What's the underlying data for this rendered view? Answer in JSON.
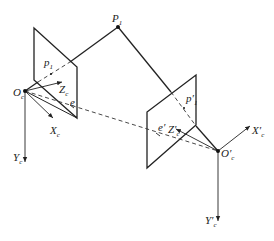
{
  "diagram": {
    "type": "epipolar-geometry",
    "colors": {
      "line": "#222222",
      "background": "#ffffff"
    },
    "points": {
      "P1": {
        "label": "P",
        "sub": "1",
        "x": 118,
        "y": 27
      },
      "Oc": {
        "label": "O",
        "sub": "c",
        "x": 25,
        "y": 91
      },
      "Oc_prime": {
        "label": "O′",
        "sub": "c",
        "x": 218,
        "y": 151
      }
    },
    "left_camera": {
      "center_label": "O",
      "center_sub": "c",
      "axes": {
        "x": "X",
        "x_sub": "c",
        "y": "Y",
        "y_sub": "c",
        "z": "Z",
        "z_sub": "c"
      },
      "image_point": {
        "label": "p",
        "sub": "1"
      },
      "epipole": "e"
    },
    "right_camera": {
      "center_label": "O′",
      "center_sub": "c",
      "axes": {
        "x": "X′",
        "x_sub": "c",
        "y": "Y′",
        "y_sub": "c",
        "z": "Z′",
        "z_sub": "c"
      },
      "image_point": {
        "label": "p′",
        "sub": "1"
      },
      "epipole": "e′"
    }
  }
}
